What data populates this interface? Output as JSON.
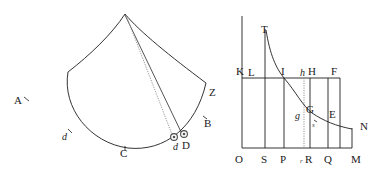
{
  "figure": {
    "background_color": "#ffffff",
    "ink_color": "#1d1d1d",
    "dotted_color": "#8a8a8a"
  },
  "left_diagram": {
    "name": "sector-figure",
    "description": "Fan shaped sector with apex at top, two curved sides meeting arc ACZ, plus straight and dotted chords from apex to points D and d",
    "labels": [
      {
        "id": "A",
        "text": "A",
        "x": 14,
        "y": 104,
        "style": "roman"
      },
      {
        "id": "d_arc",
        "text": "d",
        "x": 62,
        "y": 140,
        "style": "italic"
      },
      {
        "id": "C",
        "text": "C",
        "x": 120,
        "y": 157,
        "style": "roman"
      },
      {
        "id": "d_point",
        "text": "d",
        "x": 176,
        "y": 150,
        "style": "italic"
      },
      {
        "id": "D",
        "text": "D",
        "x": 186,
        "y": 149,
        "style": "roman"
      },
      {
        "id": "B",
        "text": "B",
        "x": 206,
        "y": 127,
        "style": "roman"
      },
      {
        "id": "Z",
        "text": "Z",
        "x": 210,
        "y": 95,
        "style": "roman"
      }
    ]
  },
  "right_diagram": {
    "name": "hyperbola-figure",
    "description": "Rectangular frame OM with hyperbolic curve T G N, vertical ordinates at S P r R Q and horizontal line K L I h H F",
    "axis_labels_bottom": [
      {
        "id": "O",
        "text": "O",
        "x": 238,
        "y": 162,
        "style": "roman"
      },
      {
        "id": "S",
        "text": "S",
        "x": 266,
        "y": 162,
        "style": "roman"
      },
      {
        "id": "P",
        "text": "P",
        "x": 283,
        "y": 162,
        "style": "roman"
      },
      {
        "id": "r",
        "text": "r",
        "x": 303,
        "y": 162,
        "style": "italic-small"
      },
      {
        "id": "R",
        "text": "R",
        "x": 309,
        "y": 162,
        "style": "roman"
      },
      {
        "id": "Q",
        "text": "Q",
        "x": 327,
        "y": 162,
        "style": "roman"
      },
      {
        "id": "M",
        "text": "M",
        "x": 355,
        "y": 162,
        "style": "roman"
      }
    ],
    "labels_upper": [
      {
        "id": "T",
        "text": "T",
        "x": 265,
        "y": 36,
        "style": "roman"
      },
      {
        "id": "K",
        "text": "K",
        "x": 239,
        "y": 75,
        "style": "roman"
      },
      {
        "id": "L",
        "text": "L",
        "x": 251,
        "y": 76,
        "style": "roman"
      },
      {
        "id": "I",
        "text": "I",
        "x": 283,
        "y": 75,
        "style": "roman"
      },
      {
        "id": "h",
        "text": "h",
        "x": 302,
        "y": 76,
        "style": "italic"
      },
      {
        "id": "H",
        "text": "H",
        "x": 311,
        "y": 75,
        "style": "roman"
      },
      {
        "id": "F",
        "text": "F",
        "x": 334,
        "y": 75,
        "style": "roman"
      }
    ],
    "labels_curve": [
      {
        "id": "g",
        "text": "g",
        "x": 296,
        "y": 117,
        "style": "italic"
      },
      {
        "id": "G",
        "text": "G",
        "x": 310,
        "y": 112,
        "style": "roman"
      },
      {
        "id": "s",
        "text": "s",
        "x": 313,
        "y": 124,
        "style": "italic-small"
      },
      {
        "id": "E",
        "text": "E",
        "x": 331,
        "y": 117,
        "style": "roman"
      },
      {
        "id": "N",
        "text": "N",
        "x": 362,
        "y": 128,
        "style": "roman"
      }
    ],
    "geometry": {
      "frame_left_x": 242,
      "frame_right_x": 352,
      "baseline_y": 148,
      "top_y": 16,
      "horizontal_KF_y": 78,
      "ordinate_S_x": 265,
      "ordinate_P_x": 284,
      "ordinate_r_x": 304,
      "ordinate_R_x": 310,
      "ordinate_Q_x": 328
    }
  }
}
